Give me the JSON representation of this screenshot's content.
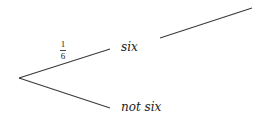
{
  "diagram": {
    "type": "probability-tree",
    "root": {
      "x": 19,
      "y": 78
    },
    "branches": [
      {
        "id": "six",
        "label": "six",
        "probability": {
          "numerator": "1",
          "denominator": "6"
        },
        "line": {
          "x1": 19,
          "y1": 78,
          "x2": 110,
          "y2": 49
        }
      },
      {
        "id": "not-six",
        "label": "not six",
        "probability": null,
        "line": {
          "x1": 19,
          "y1": 78,
          "x2": 110,
          "y2": 108
        }
      }
    ],
    "extra_lines": [
      {
        "id": "six-continuation",
        "x1": 160,
        "y1": 38,
        "x2": 252,
        "y2": 8
      }
    ],
    "colors": {
      "line": "#3a3a3a",
      "text": "#222222",
      "background": "#ffffff"
    }
  }
}
